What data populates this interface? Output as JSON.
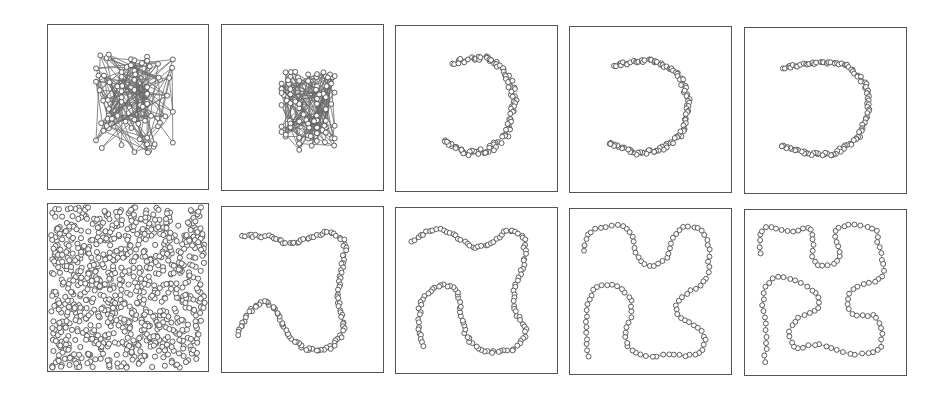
{
  "figure": {
    "colors": {
      "edge": "#6a6a6a",
      "node_stroke": "#5a5a5a",
      "node_fill": "#ffffff",
      "border": "#555555"
    },
    "panels": [
      {
        "id": "r1c1",
        "row": 1,
        "col": 1,
        "kind": "random_graph",
        "box": [
          47,
          24,
          162,
          166
        ],
        "nodes": 80,
        "extent": [
          0.3,
          0.18,
          0.78,
          0.78
        ],
        "seed": 11
      },
      {
        "id": "r1c2",
        "row": 1,
        "col": 2,
        "kind": "random_graph",
        "box": [
          221,
          24,
          163,
          167
        ],
        "nodes": 90,
        "extent": [
          0.37,
          0.28,
          0.7,
          0.76
        ],
        "seed": 23
      },
      {
        "id": "r1c3",
        "row": 1,
        "col": 3,
        "kind": "chain",
        "box": [
          395,
          25,
          163,
          167
        ],
        "nodes": 110,
        "jitter": 0.018,
        "path": [
          [
            0.36,
            0.22
          ],
          [
            0.55,
            0.19
          ],
          [
            0.68,
            0.26
          ],
          [
            0.74,
            0.45
          ],
          [
            0.7,
            0.64
          ],
          [
            0.58,
            0.76
          ],
          [
            0.42,
            0.77
          ],
          [
            0.3,
            0.69
          ]
        ]
      },
      {
        "id": "r1c4",
        "row": 1,
        "col": 4,
        "kind": "chain",
        "box": [
          569,
          26,
          163,
          167
        ],
        "nodes": 110,
        "jitter": 0.012,
        "path": [
          [
            0.28,
            0.23
          ],
          [
            0.5,
            0.2
          ],
          [
            0.67,
            0.27
          ],
          [
            0.74,
            0.45
          ],
          [
            0.71,
            0.63
          ],
          [
            0.58,
            0.74
          ],
          [
            0.42,
            0.77
          ],
          [
            0.24,
            0.7
          ]
        ]
      },
      {
        "id": "r1c5",
        "row": 1,
        "col": 5,
        "kind": "chain",
        "box": [
          744,
          27,
          163,
          167
        ],
        "nodes": 110,
        "jitter": 0.01,
        "path": [
          [
            0.24,
            0.24
          ],
          [
            0.45,
            0.21
          ],
          [
            0.64,
            0.22
          ],
          [
            0.76,
            0.36
          ],
          [
            0.77,
            0.52
          ],
          [
            0.7,
            0.67
          ],
          [
            0.55,
            0.77
          ],
          [
            0.38,
            0.76
          ],
          [
            0.22,
            0.71
          ]
        ]
      },
      {
        "id": "r2c1",
        "row": 2,
        "col": 1,
        "kind": "scatter",
        "box": [
          47,
          203,
          162,
          169
        ],
        "nodes": 900,
        "extent": [
          0.02,
          0.02,
          0.98,
          0.98
        ],
        "seed": 7
      },
      {
        "id": "r2c2",
        "row": 2,
        "col": 2,
        "kind": "chain",
        "box": [
          221,
          206,
          163,
          167
        ],
        "nodes": 130,
        "jitter": 0.01,
        "path": [
          [
            0.13,
            0.17
          ],
          [
            0.3,
            0.18
          ],
          [
            0.42,
            0.23
          ],
          [
            0.55,
            0.19
          ],
          [
            0.68,
            0.14
          ],
          [
            0.77,
            0.22
          ],
          [
            0.74,
            0.4
          ],
          [
            0.72,
            0.55
          ],
          [
            0.76,
            0.75
          ],
          [
            0.68,
            0.86
          ],
          [
            0.52,
            0.87
          ],
          [
            0.4,
            0.77
          ],
          [
            0.34,
            0.62
          ],
          [
            0.26,
            0.56
          ],
          [
            0.16,
            0.64
          ],
          [
            0.1,
            0.78
          ]
        ]
      },
      {
        "id": "r2c3",
        "row": 2,
        "col": 3,
        "kind": "chain",
        "box": [
          395,
          207,
          163,
          167
        ],
        "nodes": 130,
        "jitter": 0.008,
        "path": [
          [
            0.1,
            0.2
          ],
          [
            0.24,
            0.12
          ],
          [
            0.36,
            0.16
          ],
          [
            0.48,
            0.25
          ],
          [
            0.6,
            0.22
          ],
          [
            0.7,
            0.12
          ],
          [
            0.8,
            0.17
          ],
          [
            0.8,
            0.34
          ],
          [
            0.73,
            0.5
          ],
          [
            0.74,
            0.63
          ],
          [
            0.82,
            0.75
          ],
          [
            0.74,
            0.86
          ],
          [
            0.56,
            0.88
          ],
          [
            0.44,
            0.8
          ],
          [
            0.4,
            0.63
          ],
          [
            0.38,
            0.48
          ],
          [
            0.26,
            0.46
          ],
          [
            0.15,
            0.56
          ],
          [
            0.14,
            0.72
          ],
          [
            0.17,
            0.84
          ]
        ]
      },
      {
        "id": "r2c4",
        "row": 2,
        "col": 4,
        "kind": "chain",
        "box": [
          569,
          208,
          163,
          167
        ],
        "nodes": 110,
        "jitter": 0.006,
        "path": [
          [
            0.09,
            0.25
          ],
          [
            0.1,
            0.14
          ],
          [
            0.22,
            0.1
          ],
          [
            0.36,
            0.1
          ],
          [
            0.4,
            0.2
          ],
          [
            0.42,
            0.33
          ],
          [
            0.52,
            0.36
          ],
          [
            0.62,
            0.3
          ],
          [
            0.64,
            0.15
          ],
          [
            0.72,
            0.09
          ],
          [
            0.84,
            0.12
          ],
          [
            0.87,
            0.27
          ],
          [
            0.85,
            0.45
          ],
          [
            0.74,
            0.5
          ],
          [
            0.64,
            0.58
          ],
          [
            0.68,
            0.68
          ],
          [
            0.8,
            0.7
          ],
          [
            0.86,
            0.8
          ],
          [
            0.8,
            0.9
          ],
          [
            0.64,
            0.88
          ],
          [
            0.46,
            0.9
          ],
          [
            0.34,
            0.84
          ],
          [
            0.34,
            0.72
          ],
          [
            0.4,
            0.62
          ],
          [
            0.36,
            0.5
          ],
          [
            0.22,
            0.44
          ],
          [
            0.12,
            0.5
          ],
          [
            0.1,
            0.65
          ],
          [
            0.11,
            0.89
          ]
        ]
      },
      {
        "id": "r2c5",
        "row": 2,
        "col": 5,
        "kind": "chain",
        "box": [
          744,
          209,
          163,
          167
        ],
        "nodes": 120,
        "jitter": 0.006,
        "path": [
          [
            0.1,
            0.26
          ],
          [
            0.08,
            0.12
          ],
          [
            0.18,
            0.08
          ],
          [
            0.26,
            0.15
          ],
          [
            0.34,
            0.13
          ],
          [
            0.4,
            0.08
          ],
          [
            0.44,
            0.15
          ],
          [
            0.4,
            0.3
          ],
          [
            0.46,
            0.36
          ],
          [
            0.58,
            0.33
          ],
          [
            0.62,
            0.26
          ],
          [
            0.54,
            0.16
          ],
          [
            0.58,
            0.08
          ],
          [
            0.74,
            0.09
          ],
          [
            0.84,
            0.12
          ],
          [
            0.82,
            0.24
          ],
          [
            0.88,
            0.34
          ],
          [
            0.84,
            0.45
          ],
          [
            0.74,
            0.44
          ],
          [
            0.64,
            0.49
          ],
          [
            0.62,
            0.6
          ],
          [
            0.7,
            0.66
          ],
          [
            0.82,
            0.62
          ],
          [
            0.86,
            0.74
          ],
          [
            0.84,
            0.87
          ],
          [
            0.68,
            0.88
          ],
          [
            0.56,
            0.85
          ],
          [
            0.44,
            0.8
          ],
          [
            0.3,
            0.86
          ],
          [
            0.26,
            0.74
          ],
          [
            0.32,
            0.64
          ],
          [
            0.46,
            0.62
          ],
          [
            0.48,
            0.52
          ],
          [
            0.38,
            0.46
          ],
          [
            0.26,
            0.4
          ],
          [
            0.16,
            0.4
          ],
          [
            0.1,
            0.52
          ],
          [
            0.12,
            0.66
          ],
          [
            0.14,
            0.8
          ],
          [
            0.12,
            0.92
          ]
        ]
      }
    ]
  }
}
